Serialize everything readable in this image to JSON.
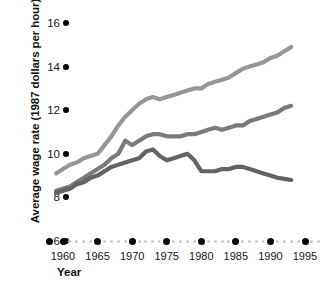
{
  "chart_data": {
    "type": "line",
    "title": "",
    "xlabel": "Year",
    "ylabel": "Average wage rate (1987 dollars per hour)",
    "xlim": [
      1958,
      1996
    ],
    "ylim": [
      6,
      16
    ],
    "xticks": [
      1960,
      1965,
      1970,
      1975,
      1980,
      1985,
      1990,
      1995
    ],
    "yticks": [
      6,
      8,
      10,
      12,
      14,
      16
    ],
    "grid": false,
    "legend": "none",
    "series": [
      {
        "name": "upper-series",
        "color": "#969696",
        "x": [
          1959,
          1960,
          1961,
          1962,
          1963,
          1964,
          1965,
          1966,
          1967,
          1968,
          1969,
          1970,
          1971,
          1972,
          1973,
          1974,
          1975,
          1976,
          1977,
          1978,
          1979,
          1980,
          1981,
          1982,
          1983,
          1984,
          1985,
          1986,
          1987,
          1988,
          1989,
          1990,
          1991,
          1992,
          1993
        ],
        "values": [
          9.1,
          9.3,
          9.5,
          9.6,
          9.8,
          9.9,
          10.0,
          10.4,
          10.8,
          11.3,
          11.7,
          12.0,
          12.3,
          12.5,
          12.6,
          12.5,
          12.6,
          12.7,
          12.8,
          12.9,
          13.0,
          13.0,
          13.2,
          13.3,
          13.4,
          13.5,
          13.7,
          13.9,
          14.0,
          14.1,
          14.2,
          14.4,
          14.5,
          14.7,
          14.9
        ]
      },
      {
        "name": "middle-series",
        "color": "#7a7a7a",
        "x": [
          1959,
          1960,
          1961,
          1962,
          1963,
          1964,
          1965,
          1966,
          1967,
          1968,
          1969,
          1970,
          1971,
          1972,
          1973,
          1974,
          1975,
          1976,
          1977,
          1978,
          1979,
          1980,
          1981,
          1982,
          1983,
          1984,
          1985,
          1986,
          1987,
          1988,
          1989,
          1990,
          1991,
          1992,
          1993
        ],
        "values": [
          8.3,
          8.4,
          8.5,
          8.7,
          8.9,
          9.1,
          9.3,
          9.5,
          9.8,
          10.0,
          10.6,
          10.4,
          10.6,
          10.8,
          10.9,
          10.9,
          10.8,
          10.8,
          10.8,
          10.9,
          10.9,
          11.0,
          11.1,
          11.2,
          11.1,
          11.2,
          11.3,
          11.3,
          11.5,
          11.6,
          11.7,
          11.8,
          11.9,
          12.1,
          12.2
        ]
      },
      {
        "name": "lower-series",
        "color": "#636363",
        "x": [
          1959,
          1960,
          1961,
          1962,
          1963,
          1964,
          1965,
          1966,
          1967,
          1968,
          1969,
          1970,
          1971,
          1972,
          1973,
          1974,
          1975,
          1976,
          1977,
          1978,
          1979,
          1980,
          1981,
          1982,
          1983,
          1984,
          1985,
          1986,
          1987,
          1988,
          1989,
          1990,
          1991,
          1992,
          1993
        ],
        "values": [
          8.2,
          8.3,
          8.4,
          8.6,
          8.7,
          8.9,
          9.0,
          9.2,
          9.4,
          9.5,
          9.6,
          9.7,
          9.8,
          10.1,
          10.2,
          9.9,
          9.7,
          9.8,
          9.9,
          10.0,
          9.7,
          9.2,
          9.2,
          9.2,
          9.3,
          9.3,
          9.4,
          9.4,
          9.3,
          9.2,
          9.1,
          9.0,
          8.9,
          8.85,
          8.8
        ]
      }
    ]
  },
  "axis": {
    "y_tick_labels": [
      "16",
      "14",
      "12",
      "10",
      "8",
      "6"
    ],
    "x_tick_labels": [
      "1960",
      "1965",
      "1970",
      "1975",
      "1980",
      "1985",
      "1990",
      "1995"
    ],
    "x_title": "Year",
    "y_title": "Average wage rate (1987 dollars per hour)"
  },
  "colors": {
    "upper": "#969696",
    "middle": "#7a7a7a",
    "lower": "#636363",
    "marker": "#000000",
    "minor_dot": "#c9c9c9",
    "background": "#ffffff"
  }
}
